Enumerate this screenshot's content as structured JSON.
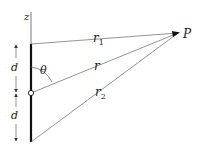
{
  "diagram": {
    "labels": {
      "z_axis": "z",
      "r1": "r",
      "r1_sub": "1",
      "r": "r",
      "r2": "r",
      "r2_sub": "2",
      "point": "P",
      "angle": "θ",
      "d_upper": "d",
      "d_lower": "d"
    },
    "colors": {
      "line": "#555555",
      "antenna": "#111111",
      "text": "#222222"
    }
  }
}
